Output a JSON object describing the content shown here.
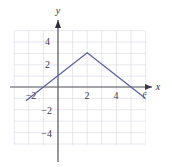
{
  "chart_data": {
    "type": "line",
    "title": "",
    "subtitle": "",
    "xlabel": "x",
    "ylabel": "y",
    "xlim": [
      -3,
      7
    ],
    "ylim": [
      -5,
      5
    ],
    "grid": true,
    "legend": null,
    "x_ticks": [
      -2,
      2,
      4,
      6
    ],
    "x_tick_labels": [
      "−2",
      "2",
      "4",
      "6"
    ],
    "y_ticks": [
      -4,
      -2,
      2,
      4
    ],
    "y_tick_labels": [
      "−4",
      "−2",
      "2",
      "4"
    ],
    "series": [
      {
        "name": "y = 3 - |x - 2|",
        "x": [
          -2.2,
          2,
          6.9
        ],
        "values": [
          -1.2,
          3,
          -1.9
        ],
        "color": "#5b5f9e",
        "vertex": [
          2,
          3
        ],
        "x_intercepts": [
          -1,
          5
        ],
        "y_intercept": 1,
        "slopes": [
          1,
          -1
        ]
      }
    ],
    "colors": {
      "curve": "#5b5f9e",
      "axis": "#4a4a55",
      "grid": "#d8d8e4",
      "background": "#ffffff",
      "tick_text": "#3b3b4a"
    }
  },
  "axes": {
    "x_axis_name": "x",
    "y_axis_name": "y"
  }
}
